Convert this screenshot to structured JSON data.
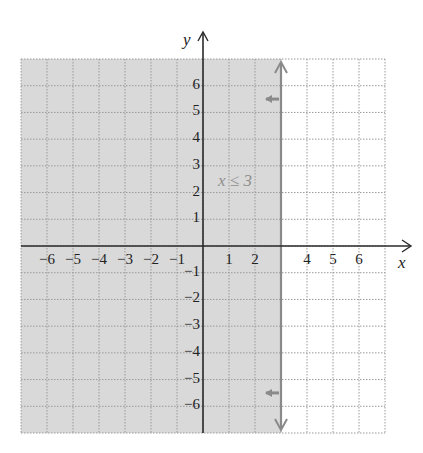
{
  "chart_data": {
    "type": "area",
    "title": "",
    "xlabel": "x",
    "ylabel": "y",
    "xlim": [
      -7,
      7
    ],
    "ylim": [
      -7,
      7
    ],
    "grid": true,
    "x_ticks": [
      -6,
      -5,
      -4,
      -3,
      -2,
      -1,
      1,
      2,
      4,
      5,
      6
    ],
    "y_ticks": [
      -6,
      -5,
      -4,
      -3,
      -2,
      -1,
      1,
      2,
      3,
      4,
      5,
      6
    ],
    "x_tick_labels": [
      "−6",
      "−5",
      "−4",
      "−3",
      "−2",
      "−1",
      "1",
      "2",
      "4",
      "5",
      "6"
    ],
    "y_tick_labels": [
      "−6",
      "−5",
      "−4",
      "−3",
      "−2",
      "−1",
      "1",
      "2",
      "3",
      "4",
      "5",
      "6"
    ],
    "inequality": {
      "label": "x ≤ 3",
      "boundary": "vertical line x = 3",
      "boundary_value": 3,
      "boundary_style": "solid",
      "shaded_side": "left",
      "direction_arrows_y": [
        5.5,
        -5.5
      ]
    },
    "legend": null
  },
  "colors": {
    "shade": "#d9d9d9",
    "grid": "#9a9a9a",
    "axis": "#2a2a2a",
    "boundary": "#8a8a8a",
    "label": "#8f8f8f"
  }
}
